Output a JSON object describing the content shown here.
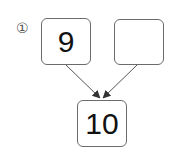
{
  "problem": {
    "number_label": "①",
    "boxes": [
      {
        "id": "top-left",
        "value": "9"
      },
      {
        "id": "top-right",
        "value": ""
      },
      {
        "id": "bottom",
        "value": "10"
      }
    ]
  }
}
